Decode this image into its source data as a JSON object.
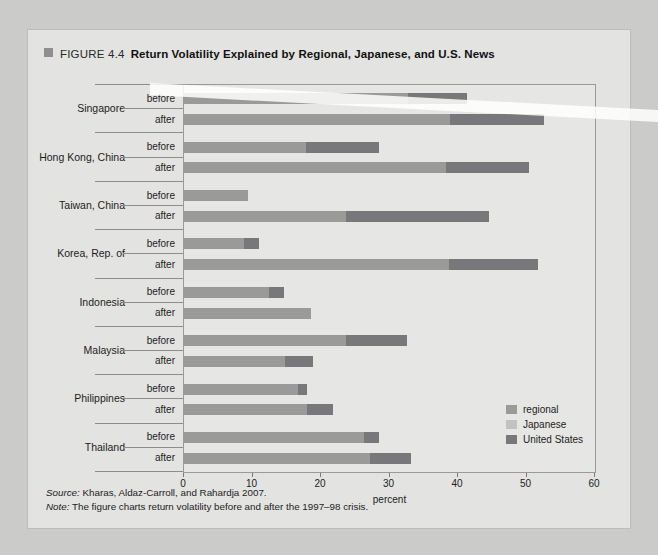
{
  "figure": {
    "marker": "square-marker",
    "number": "FIGURE 4.4",
    "title": "Return Volatility Explained by Regional, Japanese, and U.S. News"
  },
  "notes": {
    "source_label": "Source:",
    "source_text": " Kharas, Aldaz-Carroll, and Rahardja 2007.",
    "note_label": "Note:",
    "note_text": " The figure charts return volatility before and after the 1997–98 crisis."
  },
  "legend": {
    "position": "inside-right",
    "items": [
      {
        "label": "regional",
        "color": "#9a9a98"
      },
      {
        "label": "Japanese",
        "color": "#c2c2c0"
      },
      {
        "label": "United States",
        "color": "#78787a"
      }
    ]
  },
  "chart_data": {
    "type": "bar",
    "orientation": "horizontal",
    "stacked": true,
    "title": "Return Volatility Explained by Regional, Japanese, and U.S. News",
    "xlabel": "percent",
    "ylabel": "",
    "xlim": [
      0,
      60
    ],
    "xticks": [
      0,
      10,
      20,
      30,
      40,
      50,
      60
    ],
    "xtick_labels": [
      "0",
      "10",
      "20",
      "30",
      "40",
      "50",
      "60"
    ],
    "grid": false,
    "period_labels": [
      "before",
      "after"
    ],
    "categories": [
      "Singapore",
      "Hong Kong, China",
      "Taiwan, China",
      "Korea, Rep. of",
      "Indonesia",
      "Malaysia",
      "Philippines",
      "Thailand"
    ],
    "series": [
      {
        "name": "regional",
        "color": "#9a9a98"
      },
      {
        "name": "Japanese",
        "color": "#c2c2c0"
      },
      {
        "name": "United States",
        "color": "#78787a"
      }
    ],
    "values": {
      "Singapore": {
        "before": {
          "regional": 32.7,
          "Japanese": 0.0,
          "United States": 8.6
        },
        "after": {
          "regional": 38.9,
          "Japanese": 0.0,
          "United States": 13.7
        }
      },
      "Hong Kong, China": {
        "before": {
          "regional": 17.8,
          "Japanese": 0.0,
          "United States": 10.6
        },
        "after": {
          "regional": 38.2,
          "Japanese": 0.0,
          "United States": 12.1
        }
      },
      "Taiwan, China": {
        "before": {
          "regional": 9.3,
          "Japanese": 0.0,
          "United States": 0.0
        },
        "after": {
          "regional": 23.7,
          "Japanese": 0.0,
          "United States": 20.8
        }
      },
      "Korea, Rep. of": {
        "before": {
          "regional": 8.7,
          "Japanese": 0.0,
          "United States": 2.2
        },
        "after": {
          "regional": 38.7,
          "Japanese": 0.0,
          "United States": 13.0
        }
      },
      "Indonesia": {
        "before": {
          "regional": 12.4,
          "Japanese": 0.0,
          "United States": 2.2
        },
        "after": {
          "regional": 18.6,
          "Japanese": 0.0,
          "United States": 0.0
        }
      },
      "Malaysia": {
        "before": {
          "regional": 23.7,
          "Japanese": 0.0,
          "United States": 8.9
        },
        "after": {
          "regional": 14.8,
          "Japanese": 0.0,
          "United States": 4.1
        }
      },
      "Philippines": {
        "before": {
          "regional": 16.6,
          "Japanese": 0.0,
          "United States": 1.3
        },
        "after": {
          "regional": 18.0,
          "Japanese": 0.0,
          "United States": 3.7
        }
      },
      "Thailand": {
        "before": {
          "regional": 26.3,
          "Japanese": 0.0,
          "United States": 2.1
        },
        "after": {
          "regional": 27.2,
          "Japanese": 0.0,
          "United States": 5.9
        }
      }
    }
  }
}
